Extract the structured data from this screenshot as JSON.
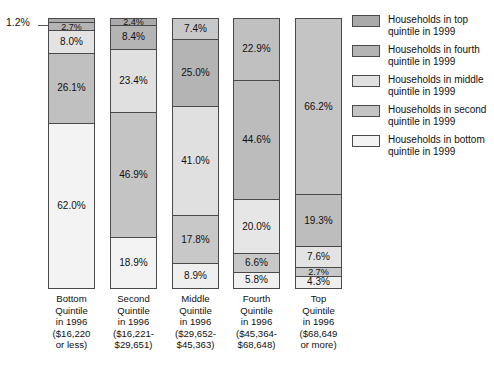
{
  "callout": {
    "value_label": "1.2%"
  },
  "chart_data": {
    "type": "bar",
    "title": "",
    "subtitle": "",
    "xlabel": "",
    "ylabel": "",
    "stacked": true,
    "normalized_percent": true,
    "ylim": [
      0,
      100
    ],
    "grid": false,
    "legend_position": "right",
    "categories": [
      "Bottom Quintile in 1996 ($16,220 or less)",
      "Second Quintile in 1996 ($16,221-$29,651)",
      "Middle Quintile in 1996 ($29,652-$45,363)",
      "Fourth Quintile in 1996 ($45,364-$68,648)",
      "Top Quintile in 1996 ($68,649 or more)"
    ],
    "series": [
      {
        "name": "Households in top quintile in 1999",
        "values": [
          1.2,
          2.4,
          7.4,
          22.9,
          66.2
        ]
      },
      {
        "name": "Households in fourth quintile in 1999",
        "values": [
          2.7,
          8.4,
          25.0,
          44.6,
          19.3
        ]
      },
      {
        "name": "Households in middle quintile in 1999",
        "values": [
          8.0,
          23.4,
          41.0,
          20.0,
          7.6
        ]
      },
      {
        "name": "Households in second quintile in 1999",
        "values": [
          26.1,
          46.9,
          17.8,
          6.6,
          2.7
        ]
      },
      {
        "name": "Households in bottom quintile in 1999",
        "values": [
          62.0,
          18.9,
          8.9,
          5.8,
          4.3
        ]
      }
    ],
    "colors": [
      "#aaaaaa",
      "#b4b4b4",
      "#d6d6d6",
      "#c0c0c0",
      "#f0f0f0"
    ]
  },
  "bars": [
    {
      "name": "bottom-quintile-1996",
      "label_lines": [
        "Bottom",
        "Quintile",
        "in 1996",
        "($16,220",
        "or less)"
      ],
      "segments": [
        {
          "label": "1.2%",
          "value": 1.2,
          "color": "#aaaaaa",
          "show_label": false
        },
        {
          "label": "2.7%",
          "value": 2.7,
          "color": "#b4b4b4",
          "show_label": true
        },
        {
          "label": "8.0%",
          "value": 8.0,
          "color": "#e3e3e3",
          "show_label": true
        },
        {
          "label": "26.1%",
          "value": 26.1,
          "color": "#c0c0c0",
          "show_label": true
        },
        {
          "label": "62.0%",
          "value": 62.0,
          "color": "#f3f3f3",
          "show_label": true
        }
      ]
    },
    {
      "name": "second-quintile-1996",
      "label_lines": [
        "Second",
        "Quintile",
        "in 1996",
        "($16,221-",
        "$29,651)"
      ],
      "segments": [
        {
          "label": "2.4%",
          "value": 2.4,
          "color": "#aaaaaa",
          "show_label": true
        },
        {
          "label": "8.4%",
          "value": 8.4,
          "color": "#b4b4b4",
          "show_label": true
        },
        {
          "label": "23.4%",
          "value": 23.4,
          "color": "#e0e0e0",
          "show_label": true
        },
        {
          "label": "46.9%",
          "value": 46.9,
          "color": "#c4c4c4",
          "show_label": true
        },
        {
          "label": "18.9%",
          "value": 18.9,
          "color": "#f3f3f3",
          "show_label": true
        }
      ]
    },
    {
      "name": "middle-quintile-1996",
      "label_lines": [
        "Middle",
        "Quintile",
        "in 1996",
        "($29,652-",
        "$45,363)"
      ],
      "segments": [
        {
          "label": "7.4%",
          "value": 7.4,
          "color": "#c8c8c8",
          "show_label": true
        },
        {
          "label": "25.0%",
          "value": 25.0,
          "color": "#b4b4b4",
          "show_label": true
        },
        {
          "label": "41.0%",
          "value": 41.0,
          "color": "#e0e0e0",
          "show_label": true
        },
        {
          "label": "17.8%",
          "value": 17.8,
          "color": "#c8c8c8",
          "show_label": true
        },
        {
          "label": "8.9%",
          "value": 8.9,
          "color": "#efefef",
          "show_label": true
        }
      ]
    },
    {
      "name": "fourth-quintile-1996",
      "label_lines": [
        "Fourth",
        "Quintile",
        "in 1996",
        "($45,364-",
        "$68,648)"
      ],
      "segments": [
        {
          "label": "22.9%",
          "value": 22.9,
          "color": "#c0c0c0",
          "show_label": true
        },
        {
          "label": "44.6%",
          "value": 44.6,
          "color": "#bcbcbc",
          "show_label": true
        },
        {
          "label": "20.0%",
          "value": 20.0,
          "color": "#e6e6e6",
          "show_label": true
        },
        {
          "label": "6.6%",
          "value": 6.6,
          "color": "#c8c8c8",
          "show_label": true
        },
        {
          "label": "5.8%",
          "value": 5.8,
          "color": "#f0f0f0",
          "show_label": true
        }
      ]
    },
    {
      "name": "top-quintile-1996",
      "label_lines": [
        "Top",
        "Quintile",
        "in 1996",
        "($68,649",
        "or more)"
      ],
      "segments": [
        {
          "label": "66.2%",
          "value": 66.2,
          "color": "#c4c4c4",
          "show_label": true
        },
        {
          "label": "19.3%",
          "value": 19.3,
          "color": "#bdbdbd",
          "show_label": true
        },
        {
          "label": "7.6%",
          "value": 7.6,
          "color": "#e3e3e3",
          "show_label": true
        },
        {
          "label": "2.7%",
          "value": 2.7,
          "color": "#c8c8c8",
          "show_label": true
        },
        {
          "label": "4.3%",
          "value": 4.3,
          "color": "#efefef",
          "show_label": true
        }
      ]
    }
  ],
  "legend": {
    "items": [
      {
        "name": "legend-top-quintile",
        "color": "#aaaaaa",
        "line1": "Households in top",
        "line2": "quintile in 1999"
      },
      {
        "name": "legend-fourth-quintile",
        "color": "#b4b4b4",
        "line1": "Households in fourth",
        "line2": "quintile in 1999"
      },
      {
        "name": "legend-middle-quintile",
        "color": "#e0e0e0",
        "line1": "Households in middle",
        "line2": "quintile in 1999"
      },
      {
        "name": "legend-second-quintile",
        "color": "#c4c4c4",
        "line1": "Households in second",
        "line2": "quintile in 1999"
      },
      {
        "name": "legend-bottom-quintile",
        "color": "#f3f3f3",
        "line1": "Households in bottom",
        "line2": "quintile in 1999"
      }
    ]
  }
}
